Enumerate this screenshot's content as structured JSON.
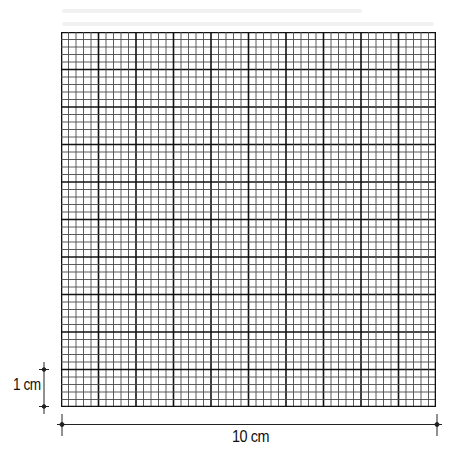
{
  "figure": {
    "type": "graph-paper-grid",
    "total_size_cm": 10,
    "major_divisions": 10,
    "minor_per_major": 5,
    "colors": {
      "minor_line": "#4a4a4a",
      "major_line": "#111111",
      "dimension_line": "#222222",
      "background": "#ffffff"
    }
  },
  "labels": {
    "vertical_scale": "1 cm",
    "horizontal_scale": "10 cm"
  }
}
